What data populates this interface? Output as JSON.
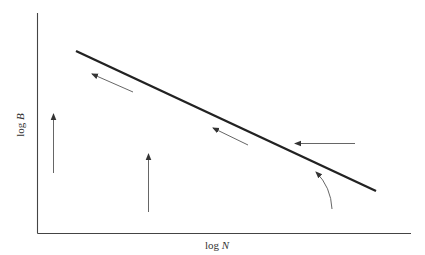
{
  "diagram": {
    "type": "flow-diagram",
    "axes": {
      "x": {
        "label_prefix": "log",
        "label_var": "N"
      },
      "y": {
        "label_prefix": "log",
        "label_var": "B"
      }
    },
    "colors": {
      "line": "#222222",
      "axis": "#444444",
      "arrow": "#555555",
      "text": "#333333"
    },
    "elements": {
      "main_line": {
        "x1": 76,
        "y1": 51,
        "x2": 376,
        "y2": 191
      },
      "arrows": [
        {
          "id": "arrow-upper-left",
          "kind": "straight",
          "from": [
            133,
            92
          ],
          "to": [
            92,
            74
          ]
        },
        {
          "id": "arrow-middle",
          "kind": "straight",
          "from": [
            248,
            145
          ],
          "to": [
            213,
            128
          ]
        },
        {
          "id": "arrow-right-horizontal",
          "kind": "straight",
          "from": [
            355,
            143
          ],
          "to": [
            295,
            143
          ]
        },
        {
          "id": "arrow-curved",
          "kind": "curved",
          "from": [
            332,
            209
          ],
          "to": [
            316,
            172
          ]
        },
        {
          "id": "arrow-vertical-left",
          "kind": "straight",
          "from": [
            53,
            173
          ],
          "to": [
            53,
            114
          ]
        },
        {
          "id": "arrow-vertical-middle",
          "kind": "straight",
          "from": [
            148,
            212
          ],
          "to": [
            148,
            154
          ]
        }
      ]
    }
  }
}
